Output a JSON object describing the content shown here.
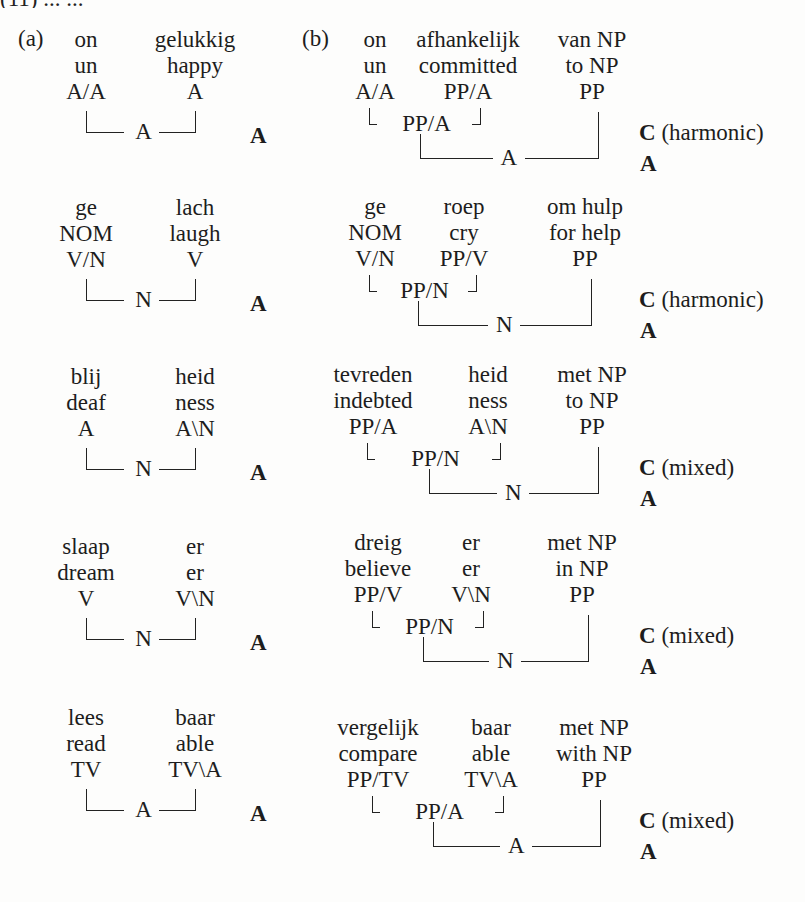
{
  "header_fragment": "(11)   ...   ...",
  "panels": {
    "a": {
      "label": "(a)"
    },
    "b": {
      "label": "(b)"
    }
  },
  "panel_a": [
    {
      "words": [
        {
          "dutch": "on",
          "english": "un",
          "category": "A/A"
        },
        {
          "dutch": "gelukkig",
          "english": "happy",
          "category": "A"
        }
      ],
      "result": "A",
      "classification": "A"
    },
    {
      "words": [
        {
          "dutch": "ge",
          "english": "NOM",
          "category": "V/N"
        },
        {
          "dutch": "lach",
          "english": "laugh",
          "category": "V"
        }
      ],
      "result": "N",
      "classification": "A"
    },
    {
      "words": [
        {
          "dutch": "blij",
          "english": "deaf",
          "category": "A"
        },
        {
          "dutch": "heid",
          "english": "ness",
          "category": "A\\N"
        }
      ],
      "result": "N",
      "classification": "A"
    },
    {
      "words": [
        {
          "dutch": "slaap",
          "english": "dream",
          "category": "V"
        },
        {
          "dutch": "er",
          "english": "er",
          "category": "V\\N"
        }
      ],
      "result": "N",
      "classification": "A"
    },
    {
      "words": [
        {
          "dutch": "lees",
          "english": "read",
          "category": "TV"
        },
        {
          "dutch": "baar",
          "english": "able",
          "category": "TV\\A"
        }
      ],
      "result": "A",
      "classification": "A"
    }
  ],
  "panel_b": [
    {
      "words": [
        {
          "dutch": "on",
          "english": "un",
          "category": "A/A"
        },
        {
          "dutch": "afhankelijk",
          "english": "committed",
          "category": "PP/A"
        },
        {
          "dutch": "van NP",
          "english": "to NP",
          "category": "PP"
        }
      ],
      "intermediate": "PP/A",
      "result": "A",
      "composition": "C",
      "composition_type": "(harmonic)",
      "classification": "A"
    },
    {
      "words": [
        {
          "dutch": "ge",
          "english": "NOM",
          "category": "V/N"
        },
        {
          "dutch": "roep",
          "english": "cry",
          "category": "PP/V"
        },
        {
          "dutch": "om hulp",
          "english": "for help",
          "category": "PP"
        }
      ],
      "intermediate": "PP/N",
      "result": "N",
      "composition": "C",
      "composition_type": "(harmonic)",
      "classification": "A"
    },
    {
      "words": [
        {
          "dutch": "tevreden",
          "english": "indebted",
          "category": "PP/A"
        },
        {
          "dutch": "heid",
          "english": "ness",
          "category": "A\\N"
        },
        {
          "dutch": "met NP",
          "english": "to NP",
          "category": "PP"
        }
      ],
      "intermediate": "PP/N",
      "result": "N",
      "composition": "C",
      "composition_type": "(mixed)",
      "classification": "A"
    },
    {
      "words": [
        {
          "dutch": "dreig",
          "english": "believe",
          "category": "PP/V"
        },
        {
          "dutch": "er",
          "english": "er",
          "category": "V\\N"
        },
        {
          "dutch": "met NP",
          "english": "in NP",
          "category": "PP"
        }
      ],
      "intermediate": "PP/N",
      "result": "N",
      "composition": "C",
      "composition_type": "(mixed)",
      "classification": "A"
    },
    {
      "words": [
        {
          "dutch": "vergelijk",
          "english": "compare",
          "category": "PP/TV"
        },
        {
          "dutch": "baar",
          "english": "able",
          "category": "TV\\A"
        },
        {
          "dutch": "met NP",
          "english": "with NP",
          "category": "PP"
        }
      ],
      "intermediate": "PP/A",
      "result": "A",
      "composition": "C",
      "composition_type": "(mixed)",
      "classification": "A"
    }
  ]
}
